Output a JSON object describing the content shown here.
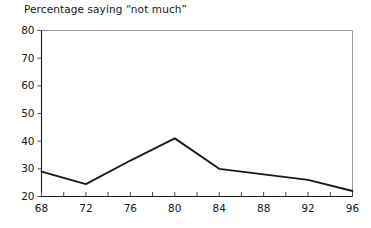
{
  "chart_data": {
    "type": "line",
    "title": "Percentage saying “not much”",
    "xlabel": "",
    "ylabel": "",
    "xlim": [
      68,
      96
    ],
    "ylim": [
      20,
      80
    ],
    "grid": false,
    "legend": "none",
    "xticks": [
      68,
      72,
      76,
      80,
      84,
      88,
      92,
      96
    ],
    "xticklabels": [
      "68",
      "72",
      "76",
      "80",
      "84",
      "88",
      "92",
      "96"
    ],
    "xminorticks": [
      70,
      74,
      78,
      82,
      86,
      90,
      94
    ],
    "yticks": [
      20,
      30,
      40,
      50,
      60,
      70,
      80
    ],
    "yticklabels": [
      "20",
      "30",
      "40",
      "50",
      "60",
      "70",
      "80"
    ],
    "series": [
      {
        "name": "Percentage saying “not much”",
        "color": "#1a1a1a",
        "x": [
          68,
          72,
          76,
          80,
          84,
          88,
          92,
          96
        ],
        "values": [
          29,
          24.5,
          33,
          41,
          30,
          28,
          26,
          22
        ]
      }
    ]
  },
  "axes": {
    "line_color": "#1a1a1a",
    "frame_color": "#9a9a9a",
    "tick_color": "#4a4a4a"
  }
}
